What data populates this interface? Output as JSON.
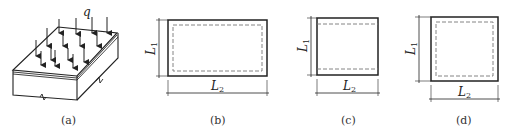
{
  "figure": {
    "panels": [
      {
        "id": "a",
        "caption": "(a)",
        "load_label": "q",
        "description": "slab with distributed load"
      },
      {
        "id": "b",
        "caption": "(b)",
        "dim_vertical": "L",
        "dim_vertical_sub": "1",
        "dim_horizontal": "L",
        "dim_horizontal_sub": "2",
        "support": "four-edge, dashed inner outline"
      },
      {
        "id": "c",
        "caption": "(c)",
        "dim_vertical": "L",
        "dim_vertical_sub": "1",
        "dim_horizontal": "L",
        "dim_horizontal_sub": "2",
        "support": "two-edge, dashed top/bottom lines"
      },
      {
        "id": "d",
        "caption": "(d)",
        "dim_vertical": "L",
        "dim_vertical_sub": "1",
        "dim_horizontal": "L",
        "dim_horizontal_sub": "2",
        "support": "four-edge, square, dashed inner outline"
      }
    ],
    "colors": {
      "stroke": "#222222",
      "dash": "#777777"
    }
  }
}
